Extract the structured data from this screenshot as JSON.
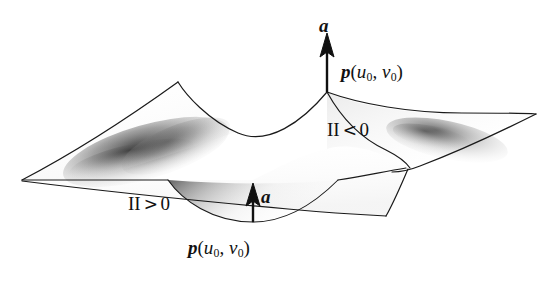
{
  "figure": {
    "background_color": "#ffffff",
    "ink_color": "#111111",
    "width": 554,
    "height": 281
  },
  "labels": {
    "normal_vector_top": "a",
    "normal_vector_bottom": "a",
    "point_top": {
      "symbol": "p",
      "open": "(",
      "u": "u",
      "u_sub": "0",
      "comma": ", ",
      "v": "v",
      "v_sub": "0",
      "close": ")"
    },
    "point_bottom": {
      "symbol": "p",
      "open": "(",
      "u": "u",
      "u_sub": "0",
      "comma": ", ",
      "v": "v",
      "v_sub": "0",
      "close": ")"
    },
    "second_form_negative": {
      "numeral": "II",
      "relation": "<",
      "value": "0"
    },
    "second_form_positive": {
      "numeral": "II",
      "relation": ">",
      "value": "0"
    }
  },
  "geometry": {
    "description": "Hand-drawn hyperbolic paraboloid (saddle) sheet seen in perspective, with two upward normal arrows at the saddle point p(u0, v0) drawn on the upper convex ridge and in the lower concave valley.",
    "saddle_point_top_px": [
      327,
      92
    ],
    "saddle_point_bottom_px": [
      253,
      222
    ],
    "left_tip_px": [
      22,
      180
    ],
    "right_tip_px": [
      536,
      114
    ],
    "upper_left_peak_px": [
      178,
      82
    ],
    "lower_right_corner_px": [
      386,
      216
    ],
    "arrow_top": {
      "x": 327,
      "y_tail": 92,
      "y_head": 38
    },
    "arrow_bottom": {
      "x": 253,
      "y_tail": 222,
      "y_head": 185
    },
    "shaded_folds": [
      "left-fold-crescent",
      "right-fold-crescent",
      "bottom-valley"
    ]
  }
}
